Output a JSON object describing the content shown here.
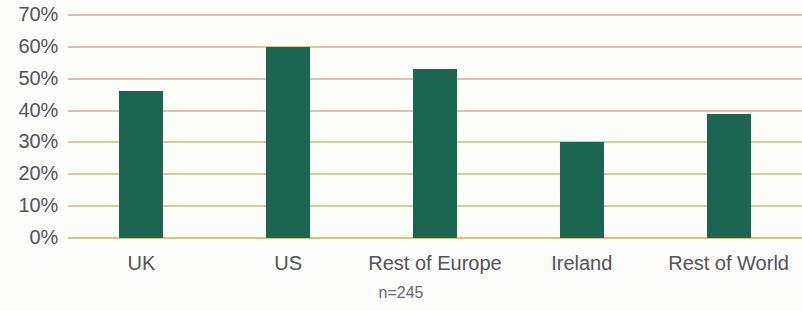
{
  "chart_data": {
    "type": "bar",
    "title": "",
    "subtitle": "",
    "xlabel": "",
    "ylabel": "",
    "categories": [
      "UK",
      "US",
      "Rest of Europe",
      "Ireland",
      "Rest of World"
    ],
    "values": [
      46,
      60,
      53,
      30,
      39
    ],
    "value_labels": [
      "46%",
      "60%",
      "53%",
      "30%",
      "39%"
    ],
    "ylim": [
      0,
      70
    ],
    "ytick_values": [
      70,
      60,
      50,
      40,
      30,
      20,
      10,
      0
    ],
    "ytick_labels": [
      "70%",
      "60%",
      "50%",
      "40%",
      "30%",
      "20%",
      "10%",
      "0%"
    ],
    "grid": true,
    "grid_axis": "y",
    "legend": false,
    "legend_position": "none",
    "annotations": [
      "n=245"
    ],
    "series": [
      {
        "name": "",
        "values": [
          46,
          60,
          53,
          30,
          39
        ]
      }
    ],
    "colors": {
      "bar": "#1A6651",
      "gridline": "#DCC99B",
      "baseline": "#D9C185",
      "tick_text": "#55525A",
      "annotation_text": "#6A6870",
      "background": "#FDFDFB"
    }
  },
  "footnote": {
    "text": "n=245"
  }
}
